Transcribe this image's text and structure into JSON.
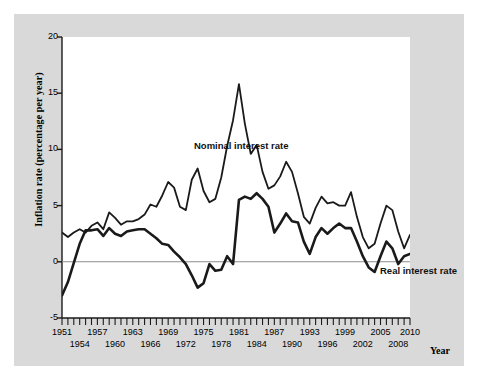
{
  "chart_data": {
    "type": "line",
    "title": "",
    "xlabel": "Year",
    "ylabel": "Inflation rate (percentage per year)",
    "xlim": [
      1951,
      2010
    ],
    "ylim": [
      -5,
      20
    ],
    "yticks": [
      20,
      15,
      10,
      5,
      0,
      -5
    ],
    "grid": false,
    "zero_line": true,
    "legend": "inline-annotations",
    "xtick_labels_top": [
      "1951",
      "1957",
      "1963",
      "1969",
      "1975",
      "1981",
      "1987",
      "1993",
      "1999",
      "2005",
      "2010"
    ],
    "xtick_labels_bottom": [
      "1954",
      "1960",
      "1966",
      "1972",
      "1978",
      "1984",
      "1990",
      "1996",
      "2002",
      "2008"
    ],
    "x": [
      1951,
      1952,
      1953,
      1954,
      1955,
      1956,
      1957,
      1958,
      1959,
      1960,
      1961,
      1962,
      1963,
      1964,
      1965,
      1966,
      1967,
      1968,
      1969,
      1970,
      1971,
      1972,
      1973,
      1974,
      1975,
      1976,
      1977,
      1978,
      1979,
      1980,
      1981,
      1982,
      1983,
      1984,
      1985,
      1986,
      1987,
      1988,
      1989,
      1990,
      1991,
      1992,
      1993,
      1994,
      1995,
      1996,
      1997,
      1998,
      1999,
      2000,
      2001,
      2002,
      2003,
      2004,
      2005,
      2006,
      2007,
      2008,
      2009,
      2010
    ],
    "series": [
      {
        "name": "Nominal interest rate",
        "color": "#1a1a1a",
        "values": [
          2.6,
          2.2,
          2.6,
          2.9,
          2.6,
          3.2,
          3.5,
          2.9,
          4.4,
          3.9,
          3.3,
          3.6,
          3.6,
          3.8,
          4.2,
          5.1,
          4.9,
          5.9,
          7.1,
          6.6,
          4.9,
          4.6,
          7.3,
          8.3,
          6.3,
          5.3,
          5.6,
          7.5,
          10.3,
          12.6,
          15.8,
          12.3,
          9.6,
          10.4,
          8.0,
          6.5,
          6.8,
          7.6,
          8.9,
          8.0,
          6.1,
          4.0,
          3.4,
          4.8,
          5.8,
          5.2,
          5.3,
          5.0,
          5.0,
          6.2,
          4.0,
          2.2,
          1.2,
          1.6,
          3.4,
          5.0,
          4.6,
          2.7,
          1.2,
          2.4
        ]
      },
      {
        "name": "Real interest rate",
        "color": "#1a1a1a",
        "values": [
          -3.0,
          -1.8,
          -0.1,
          1.6,
          2.8,
          2.8,
          2.9,
          2.3,
          3.0,
          2.5,
          2.3,
          2.7,
          2.8,
          2.9,
          2.9,
          2.5,
          2.1,
          1.6,
          1.5,
          0.9,
          0.4,
          -0.2,
          -1.2,
          -2.3,
          -1.9,
          -0.2,
          -0.8,
          -0.7,
          0.5,
          -0.2,
          5.5,
          5.8,
          5.6,
          6.1,
          5.6,
          4.9,
          2.6,
          3.4,
          4.3,
          3.6,
          3.5,
          1.8,
          0.7,
          2.2,
          3.0,
          2.5,
          3.0,
          3.4,
          3.0,
          3.0,
          1.8,
          0.5,
          -0.5,
          -0.9,
          0.5,
          1.8,
          1.2,
          -0.2,
          0.5,
          0.7
        ]
      }
    ]
  },
  "axis": {
    "ylabel_text": "Inflation rate (percentage per year)",
    "xlabel_text": "Year"
  },
  "annotations": {
    "nominal_label": "Nominal interest rate",
    "real_label": "Real interest rate"
  }
}
